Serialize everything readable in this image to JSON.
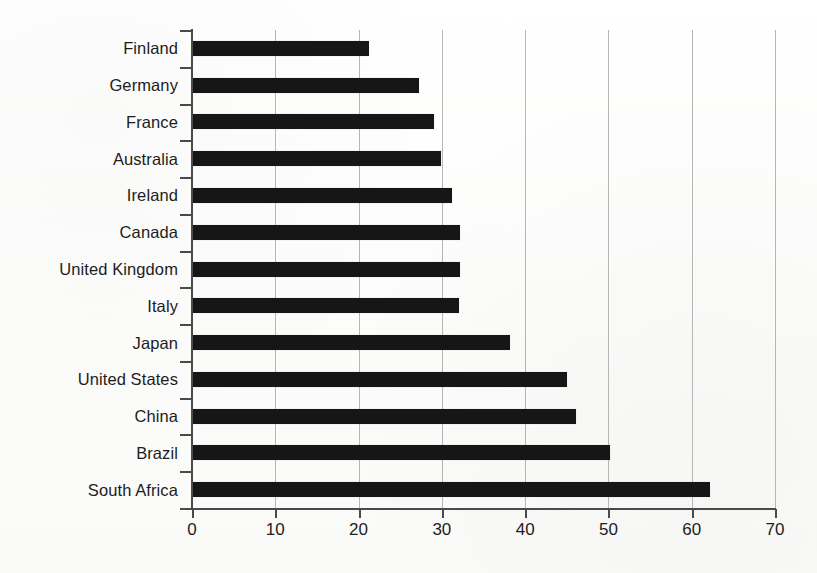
{
  "chart_data": {
    "type": "bar",
    "orientation": "horizontal",
    "title": "",
    "subtitle": "",
    "xlabel": "",
    "ylabel": "",
    "xlim": [
      0,
      70
    ],
    "xticks": [
      0,
      10,
      20,
      30,
      40,
      50,
      60,
      70
    ],
    "xtick_labels": [
      "0",
      "10",
      "20",
      "30",
      "40",
      "50",
      "60",
      "70"
    ],
    "grid": "vertical",
    "legend": "none",
    "bar_color": "#161616",
    "gridline_color": "#b6b6b6",
    "axis_color": "#4a4a4a",
    "background_color": "#fdfdfc",
    "categories": [
      "Finland",
      "Germany",
      "France",
      "Australia",
      "Ireland",
      "Canada",
      "United Kingdom",
      "Italy",
      "Japan",
      "United States",
      "China",
      "Brazil",
      "South Africa"
    ],
    "values": [
      21.2,
      27.3,
      29.0,
      29.9,
      31.2,
      32.2,
      32.2,
      32.0,
      38.2,
      45.0,
      46.1,
      50.2,
      62.2
    ]
  }
}
